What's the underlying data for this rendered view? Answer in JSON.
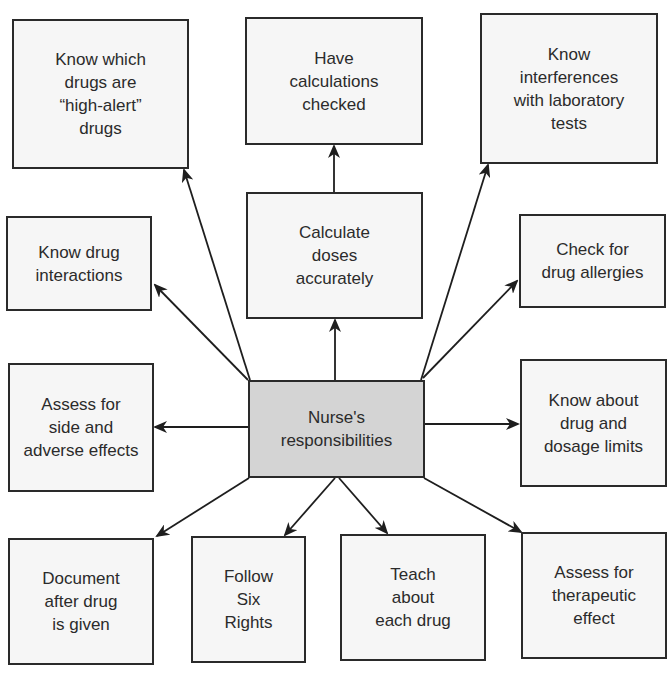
{
  "diagram": {
    "colors": {
      "border": "#2a2a2a",
      "node_fill": "#f6f6f6",
      "center_fill": "#d4d4d4",
      "text": "#2b2b2b",
      "arrow": "#1e1e1e"
    },
    "center": {
      "id": "nurse",
      "label": "Nurse's\nresponsibilities"
    },
    "nodes": [
      {
        "id": "high-alert",
        "label": "Know which\ndrugs are\n“high-alert”\ndrugs"
      },
      {
        "id": "calc-checked",
        "label": "Have\ncalculations\nchecked"
      },
      {
        "id": "lab-interference",
        "label": "Know\ninterferences\nwith laboratory\ntests"
      },
      {
        "id": "interactions",
        "label": "Know drug\ninteractions"
      },
      {
        "id": "calc-doses",
        "label": "Calculate\ndoses\naccurately"
      },
      {
        "id": "allergies",
        "label": "Check for\ndrug allergies"
      },
      {
        "id": "side-effects",
        "label": "Assess for\nside and\nadverse effects"
      },
      {
        "id": "dosage-limits",
        "label": "Know about\ndrug and\ndosage limits"
      },
      {
        "id": "document",
        "label": "Document\nafter drug\nis given"
      },
      {
        "id": "six-rights",
        "label": "Follow\nSix\nRights"
      },
      {
        "id": "teach",
        "label": "Teach\nabout\neach drug"
      },
      {
        "id": "therapeutic",
        "label": "Assess for\ntherapeutic\neffect"
      }
    ],
    "edges": [
      {
        "from": "nurse",
        "to": "high-alert"
      },
      {
        "from": "nurse",
        "to": "interactions"
      },
      {
        "from": "nurse",
        "to": "side-effects"
      },
      {
        "from": "nurse",
        "to": "calc-doses"
      },
      {
        "from": "calc-doses",
        "to": "calc-checked"
      },
      {
        "from": "nurse",
        "to": "lab-interference"
      },
      {
        "from": "nurse",
        "to": "allergies"
      },
      {
        "from": "nurse",
        "to": "dosage-limits"
      },
      {
        "from": "nurse",
        "to": "document"
      },
      {
        "from": "nurse",
        "to": "six-rights"
      },
      {
        "from": "nurse",
        "to": "teach"
      },
      {
        "from": "nurse",
        "to": "therapeutic"
      }
    ]
  }
}
